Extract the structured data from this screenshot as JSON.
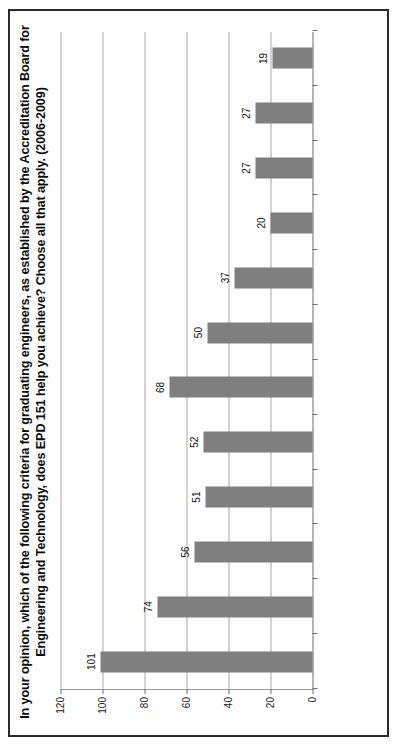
{
  "chart_data": {
    "type": "bar",
    "orientation": "vertical",
    "title": "In your opinion, which of the following criteria for graduating engineers, as established by the Accreditation Board for Engineering and Technology, does EPD 151 help you achieve? Choose all that apply. (2006-2009)",
    "xlabel": "",
    "ylabel": "",
    "ylim": [
      0,
      120
    ],
    "yticks": [
      0,
      20,
      40,
      60,
      80,
      100,
      120
    ],
    "grid": true,
    "legend": "none",
    "categories": [
      "Total Respondents",
      "an ability to use the techniques, skills, and modern engineering tools necessary for engineering practice.",
      "a knowledge of contemporary issues",
      "a recognition of the need for, and an ability to engage in life-long learning",
      "the broad education necessary to understand the impact of engineering solutions in a global and societal context",
      "an ability to communicate effectively",
      "an understanding of professional and ethical responsibility",
      "an ability to identify, formulate, and solve engineering problems",
      "an ability to function on multi-disciplinary teams",
      "an ability to design a system, component, or process to meet desired needs",
      "an ability to design and conduct experiments, as well as to analyze and interpret data",
      "an ability to apply knowledge of mathematics, science, and engineering"
    ],
    "values": [
      101,
      74,
      56,
      51,
      52,
      68,
      50,
      37,
      20,
      27,
      27,
      19
    ],
    "value_labels": [
      "101",
      "74",
      "56",
      "51",
      "52",
      "68",
      "50",
      "37",
      "20",
      "27",
      "27",
      "19"
    ],
    "tick_labels": [
      "0",
      "20",
      "40",
      "60",
      "80",
      "100",
      "120"
    ],
    "colors": {
      "bar": "#7f7f7f",
      "gridline": "#a8a8a8",
      "axis": "#6e6e6e",
      "text": "#1a1a1a",
      "page_border": "#2b2b2b",
      "background": "#ffffff"
    }
  }
}
